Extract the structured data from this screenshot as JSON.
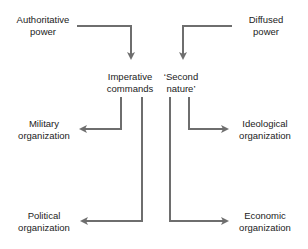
{
  "diagram": {
    "nodes": {
      "authoritative": {
        "line1": "Authoritative",
        "line2": "power"
      },
      "diffused": {
        "line1": "Diffused",
        "line2": "power"
      },
      "imperative": {
        "line1": "Imperative",
        "line2": "commands"
      },
      "second_nature": {
        "line1": "‘Second",
        "line2": "nature’"
      },
      "military": {
        "line1": "Military",
        "line2": "organization"
      },
      "ideological": {
        "line1": "Ideological",
        "line2": "organization"
      },
      "political": {
        "line1": "Political",
        "line2": "organization"
      },
      "economic": {
        "line1": "Economic",
        "line2": "organization"
      }
    },
    "edges": [
      {
        "from": "Authoritative power",
        "to": "Imperative commands"
      },
      {
        "from": "Diffused power",
        "to": "'Second nature'"
      },
      {
        "from": "Imperative commands",
        "to": "Military organization"
      },
      {
        "from": "Imperative commands",
        "to": "Political organization"
      },
      {
        "from": "'Second nature'",
        "to": "Ideological organization"
      },
      {
        "from": "'Second nature'",
        "to": "Economic organization"
      }
    ],
    "colors": {
      "arrow": "#6e6e6e",
      "text": "#222222"
    }
  }
}
